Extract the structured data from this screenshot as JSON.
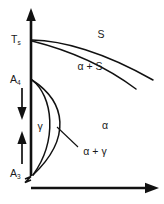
{
  "diagram": {
    "type": "phase-diagram",
    "stroke_color": "#111111",
    "background_color": "#ffffff",
    "axes": {
      "vertical": {
        "name": "temperature-axis",
        "arrow": "up",
        "has_break": true,
        "break_position_label": "below A3"
      },
      "horizontal": {
        "name": "composition-axis",
        "arrow": "right"
      }
    },
    "axis_labels": [
      {
        "text": "T",
        "sub": "s",
        "name": "label-ts",
        "meaning": "solidus temperature"
      },
      {
        "text": "A",
        "sub": "4",
        "name": "label-a4",
        "meaning": "A4 transformation point"
      },
      {
        "text": "A",
        "sub": "3",
        "name": "label-a3",
        "meaning": "A3 transformation point"
      }
    ],
    "range_arrows": [
      {
        "name": "gamma-range-arrow-down",
        "direction": "down"
      },
      {
        "name": "gamma-range-arrow-up",
        "direction": "up"
      }
    ],
    "region_labels": [
      {
        "text": "S",
        "name": "region-label-s",
        "meaning": "liquid solution"
      },
      {
        "text": "α + S",
        "name": "region-label-alpha-plus-s",
        "meaning": "alpha plus liquid"
      },
      {
        "text": "α",
        "name": "region-label-alpha",
        "meaning": "alpha ferrite"
      },
      {
        "text": "γ",
        "name": "region-label-gamma",
        "meaning": "gamma austenite loop"
      },
      {
        "text": "α + γ",
        "name": "region-label-alpha-plus-gamma",
        "meaning": "alpha plus gamma two phase"
      }
    ],
    "curves": [
      {
        "name": "liquidus-curve",
        "from": "Ts",
        "to": "lower-right"
      },
      {
        "name": "solidus-curve",
        "from": "Ts",
        "to": "lower-right"
      },
      {
        "name": "gamma-loop-outer-curve",
        "from": "A4",
        "to": "A3"
      },
      {
        "name": "gamma-loop-inner-curve",
        "from": "A4",
        "to": "A3"
      }
    ]
  }
}
